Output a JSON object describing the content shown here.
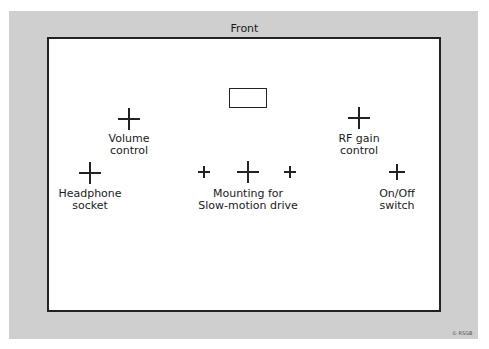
{
  "diagram": {
    "front_label": "Front",
    "copyright": "© RSGB",
    "caption": "",
    "components": [
      {
        "id": "volume",
        "lines": [
          "Volume",
          "control"
        ]
      },
      {
        "id": "headphone",
        "lines": [
          "Headphone",
          "socket"
        ]
      },
      {
        "id": "mounting",
        "lines": [
          "Mounting for",
          "Slow-motion drive"
        ]
      },
      {
        "id": "rf_gain",
        "lines": [
          "RF gain",
          "control"
        ]
      },
      {
        "id": "onoff",
        "lines": [
          "On/Off",
          "switch"
        ]
      }
    ],
    "colors": {
      "backdrop": "#cfcfcf",
      "panel": "#ffffff",
      "line": "#222222"
    }
  }
}
